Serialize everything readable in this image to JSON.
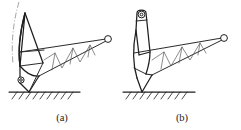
{
  "figure": {
    "background_color": "#ffffff",
    "stroke_color": "#2b2b2b",
    "thin_stroke_color": "#595959",
    "centerline_color": "#8c8c8c",
    "width": 241,
    "height": 130
  },
  "panels": [
    {
      "id": "panel-a",
      "caption": "(a)",
      "caption_x": 62,
      "caption_y": 120,
      "mast_type": "curved-tapered-mast",
      "has_centerline_arc": true,
      "pivot_label": "base-pivot-circle",
      "tip_label": "boom-tip-pulley",
      "ground_label": "hatched-ground",
      "truss_bays": 4
    },
    {
      "id": "panel-b",
      "caption": "(b)",
      "caption_x": 182,
      "caption_y": 120,
      "mast_type": "upright-rounded-mast",
      "has_centerline_arc": false,
      "pivot_label": "apex-pivot-circle",
      "tip_label": "boom-tip-pulley",
      "ground_label": "hatched-ground",
      "truss_bays": 4
    }
  ],
  "labels": {
    "caption_a": "(a)",
    "caption_b": "(b)"
  }
}
